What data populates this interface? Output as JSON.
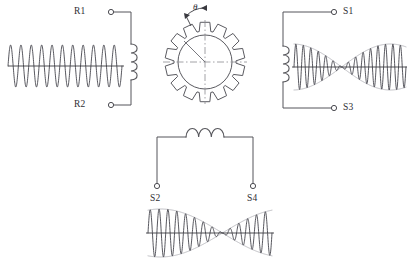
{
  "diagram": {
    "stroke_color": "#55555a",
    "carrier_color": "#3a3a42",
    "envelope_color": "#b4b4ba",
    "background_color": "#ffffff"
  },
  "rotor": {
    "name": "slotted-rotor",
    "tooth_count": 14,
    "angle_symbol": "θ",
    "hub_radius": 27,
    "outer_radius": 40,
    "center_x": 205,
    "center_y": 62
  },
  "terminals": [
    {
      "id": "R1",
      "label": "R1",
      "x": 92,
      "y": 12,
      "marker_x": 111,
      "marker_y": 12,
      "label_align": "right"
    },
    {
      "id": "R2",
      "label": "R2",
      "x": 92,
      "y": 105,
      "marker_x": 111,
      "marker_y": 105,
      "label_align": "right"
    },
    {
      "id": "S1",
      "label": "S1",
      "x": 343,
      "y": 12,
      "marker_x": 334,
      "marker_y": 12,
      "label_align": "left"
    },
    {
      "id": "S3",
      "label": "S3",
      "x": 343,
      "y": 108,
      "marker_x": 334,
      "marker_y": 108,
      "label_align": "left"
    },
    {
      "id": "S2",
      "label": "S2",
      "x": 157,
      "y": 200,
      "marker_x": 157,
      "marker_y": 186,
      "label_align": "center"
    },
    {
      "id": "S4",
      "label": "S4",
      "x": 253,
      "y": 200,
      "marker_x": 253,
      "marker_y": 186,
      "label_align": "center"
    }
  ],
  "windings": [
    {
      "id": "rotor-winding",
      "orientation": "vertical",
      "turns": 4,
      "x": 131,
      "y_start": 44,
      "y_end": 80
    },
    {
      "id": "stator-winding-s1-s3",
      "orientation": "vertical",
      "turns": 4,
      "x": 283,
      "y_start": 46,
      "y_end": 82
    },
    {
      "id": "stator-winding-s2-s4",
      "orientation": "horizontal",
      "turns": 3,
      "y": 137,
      "x_start": 186,
      "x_end": 224
    }
  ],
  "waveforms": [
    {
      "id": "excitation-waveform",
      "name": "rotor-excitation-carrier",
      "description": "Constant amplitude reference carrier applied to rotor R1-R2",
      "modulated": false,
      "cycles": 11,
      "amplitude": 21,
      "axis_y": 66,
      "x_start": 8,
      "x_end": 122
    },
    {
      "id": "s1-s3-waveform",
      "name": "stator-s1-s3-modulated-output",
      "description": "Amplitude modulated output across S1-S3 with sine envelope",
      "modulated": true,
      "carrier_cycles": 15,
      "envelope_cycles": 1.15,
      "envelope_phase_deg": 20,
      "amplitude": 23,
      "axis_y": 67,
      "x_start": 294,
      "x_end": 406
    },
    {
      "id": "s2-s4-waveform",
      "name": "stator-s2-s4-modulated-output",
      "description": "Amplitude modulated output across S2-S4 with cosine envelope and central null",
      "modulated": true,
      "carrier_cycles": 14,
      "envelope_cycles": 1.0,
      "envelope_phase_deg": 0,
      "amplitude": 24,
      "axis_y": 233,
      "x_start": 148,
      "x_end": 272
    }
  ],
  "circuits": [
    {
      "id": "rotor-circuit",
      "name": "rotor-loop-r1-r2",
      "path": "M 111 12 L 131 12 L 131 44 M 131 80 L 131 105 L 111 105"
    },
    {
      "id": "stator-circuit-s1-s3",
      "name": "stator-loop-s1-s3",
      "path": "M 334 12 L 283 12 L 283 46 M 283 82 L 283 108 L 334 108"
    },
    {
      "id": "stator-circuit-s2-s4",
      "name": "stator-loop-s2-s4",
      "path": "M 157 186 L 157 137 L 186 137 M 224 137 L 253 137 L 253 186"
    }
  ]
}
